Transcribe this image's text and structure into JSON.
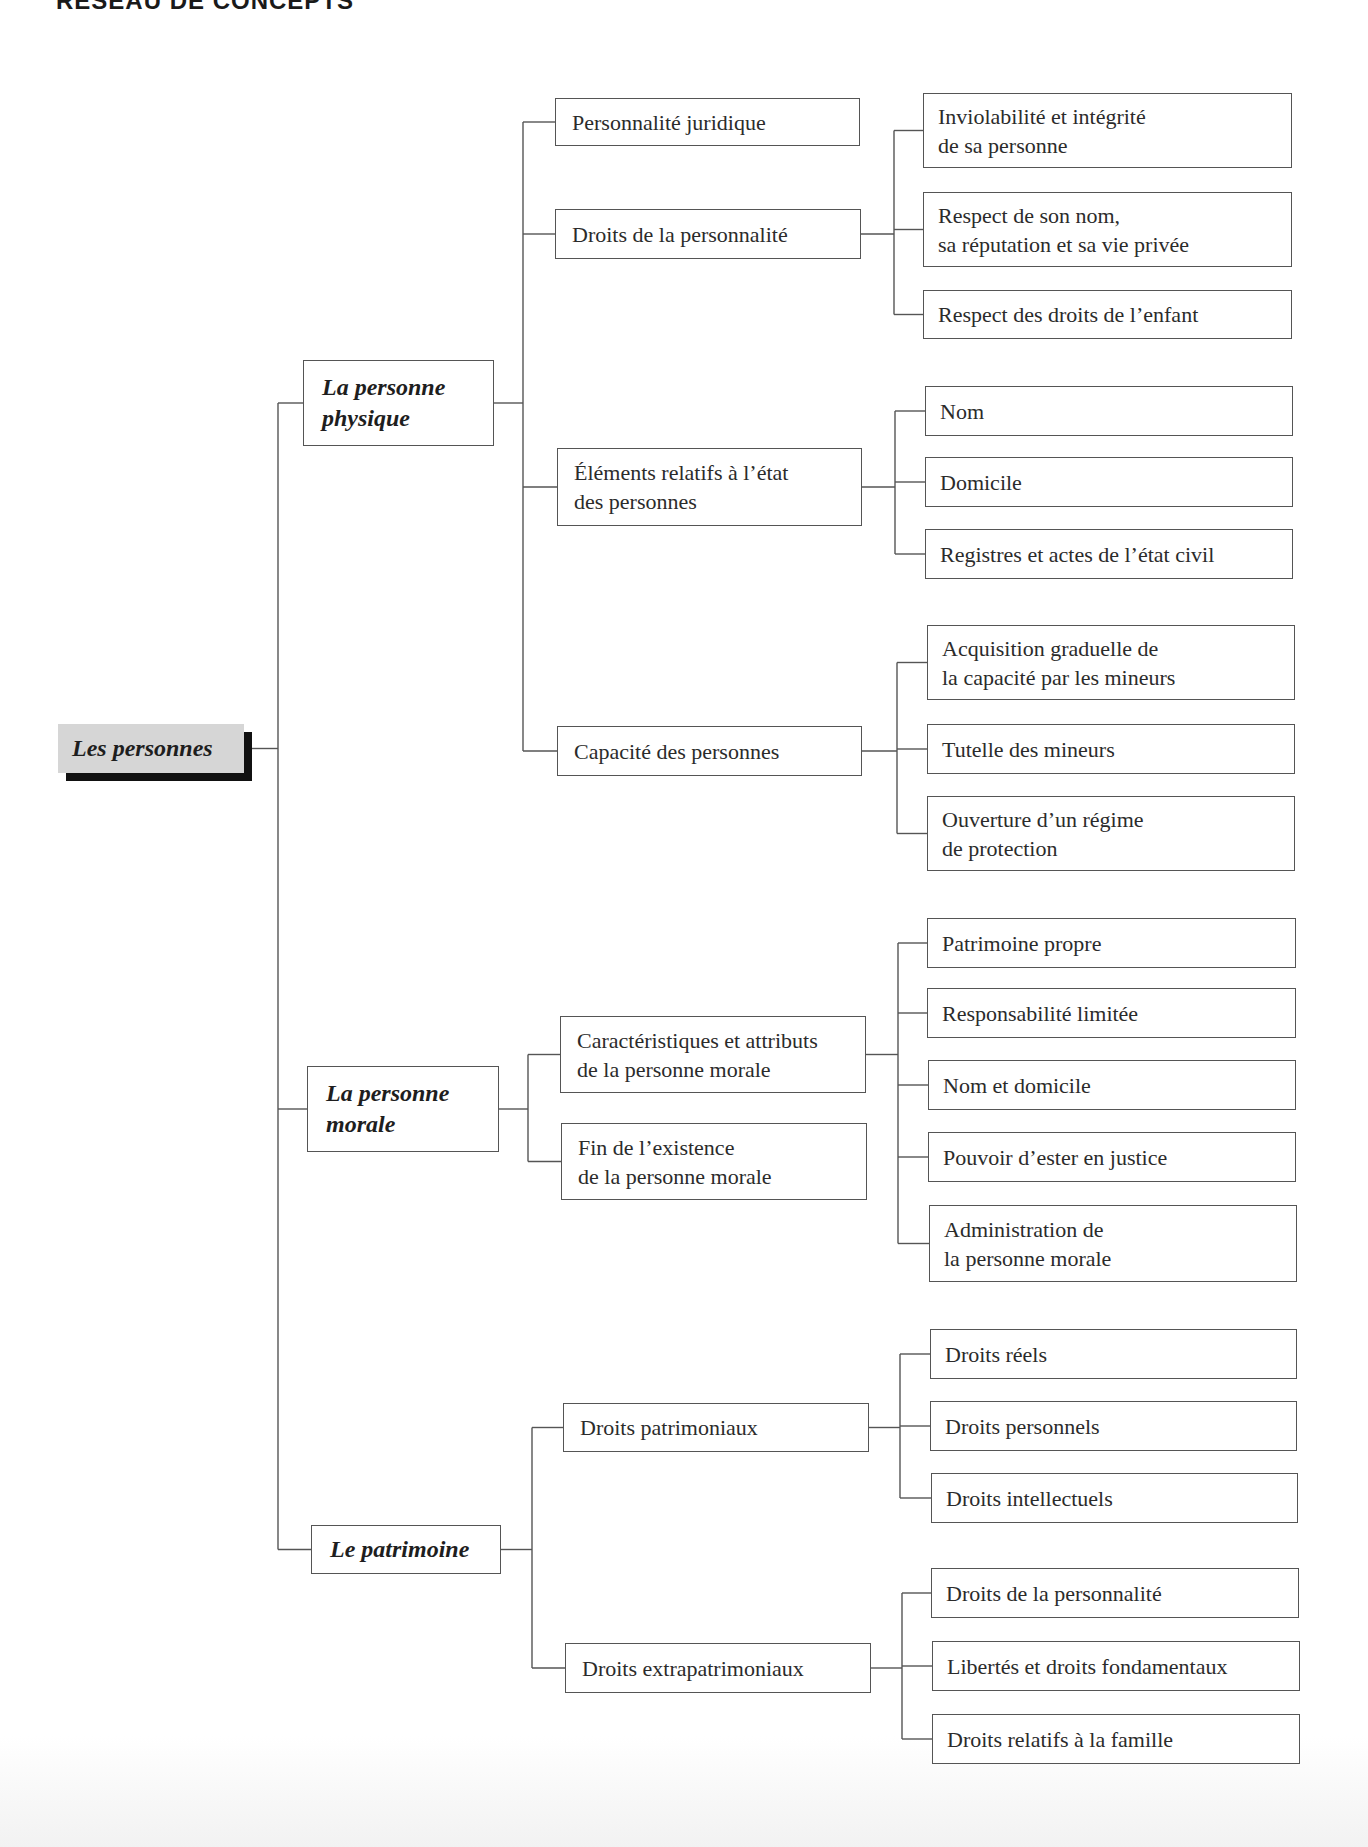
{
  "header": {
    "title_partial": "RÉSEAU DE CONCEPTS"
  },
  "colors": {
    "line": "#555555",
    "root_fill": "#d6d6d6",
    "root_shadow": "#111111",
    "text": "#2b2b2b"
  },
  "root": {
    "label": "Les personnes",
    "x": 58,
    "y": 724,
    "w": 186,
    "h": 49
  },
  "trunk": {
    "x": 278
  },
  "branches": [
    {
      "label": "La personne\nphysique",
      "x": 303,
      "y": 360,
      "w": 191,
      "h": 86,
      "spine_x": 523,
      "children": [
        {
          "label": "Personnalité juridique",
          "x": 555,
          "y": 98,
          "w": 305,
          "h": 48,
          "children": []
        },
        {
          "label": "Droits de la personnalité",
          "x": 555,
          "y": 209,
          "w": 306,
          "h": 50,
          "spine_x": 894,
          "children": [
            {
              "label": "Inviolabilité et intégrité\nde sa personne",
              "x": 923,
              "y": 93,
              "w": 369,
              "h": 75
            },
            {
              "label": "Respect de son nom,\nsa réputation et sa vie privée",
              "x": 923,
              "y": 192,
              "w": 369,
              "h": 75
            },
            {
              "label": "Respect des droits de l’enfant",
              "x": 923,
              "y": 290,
              "w": 369,
              "h": 49
            }
          ]
        },
        {
          "label": "Éléments relatifs à l’état\ndes personnes",
          "x": 557,
          "y": 448,
          "w": 305,
          "h": 78,
          "spine_x": 895,
          "children": [
            {
              "label": "Nom",
              "x": 925,
              "y": 386,
              "w": 368,
              "h": 50
            },
            {
              "label": "Domicile",
              "x": 925,
              "y": 457,
              "w": 368,
              "h": 50
            },
            {
              "label": "Registres et actes de l’état civil",
              "x": 925,
              "y": 529,
              "w": 368,
              "h": 50
            }
          ]
        },
        {
          "label": "Capacité des personnes",
          "x": 557,
          "y": 726,
          "w": 305,
          "h": 50,
          "spine_x": 897,
          "children": [
            {
              "label": "Acquisition graduelle de\nla capacité par les mineurs",
              "x": 927,
              "y": 625,
              "w": 368,
              "h": 75
            },
            {
              "label": "Tutelle des mineurs",
              "x": 927,
              "y": 724,
              "w": 368,
              "h": 50
            },
            {
              "label": "Ouverture d’un régime\nde protection",
              "x": 927,
              "y": 796,
              "w": 368,
              "h": 75
            }
          ]
        }
      ]
    },
    {
      "label": "La personne\nmorale",
      "x": 307,
      "y": 1066,
      "w": 192,
      "h": 86,
      "spine_x": 528,
      "children": [
        {
          "label": "Caractéristiques et attributs\nde la personne morale",
          "x": 560,
          "y": 1016,
          "w": 306,
          "h": 77,
          "spine_x": 898,
          "children": [
            {
              "label": "Patrimoine propre",
              "x": 927,
              "y": 918,
              "w": 369,
              "h": 50
            },
            {
              "label": "Responsabilité limitée",
              "x": 927,
              "y": 988,
              "w": 369,
              "h": 50
            },
            {
              "label": "Nom et domicile",
              "x": 928,
              "y": 1060,
              "w": 368,
              "h": 50
            },
            {
              "label": "Pouvoir d’ester en justice",
              "x": 928,
              "y": 1132,
              "w": 368,
              "h": 50
            },
            {
              "label": "Administration de\nla personne morale",
              "x": 929,
              "y": 1205,
              "w": 368,
              "h": 77
            }
          ]
        },
        {
          "label": "Fin de l’existence\nde la personne morale",
          "x": 561,
          "y": 1123,
          "w": 306,
          "h": 77,
          "children": []
        }
      ]
    },
    {
      "label": "Le patrimoine",
      "x": 311,
      "y": 1525,
      "w": 190,
      "h": 49,
      "spine_x": 532,
      "children": [
        {
          "label": "Droits patrimoniaux",
          "x": 563,
          "y": 1403,
          "w": 306,
          "h": 49,
          "spine_x": 900,
          "children": [
            {
              "label": "Droits réels",
              "x": 930,
              "y": 1329,
              "w": 367,
              "h": 50
            },
            {
              "label": "Droits personnels",
              "x": 930,
              "y": 1401,
              "w": 367,
              "h": 50
            },
            {
              "label": "Droits intellectuels",
              "x": 931,
              "y": 1473,
              "w": 367,
              "h": 50
            }
          ]
        },
        {
          "label": "Droits extrapatrimoniaux",
          "x": 565,
          "y": 1643,
          "w": 306,
          "h": 50,
          "spine_x": 902,
          "children": [
            {
              "label": "Droits de la personnalité",
              "x": 931,
              "y": 1568,
              "w": 368,
              "h": 50
            },
            {
              "label": "Libertés et droits fondamentaux",
              "x": 932,
              "y": 1641,
              "w": 368,
              "h": 50
            },
            {
              "label": "Droits relatifs à la famille",
              "x": 932,
              "y": 1714,
              "w": 368,
              "h": 50
            }
          ]
        }
      ]
    }
  ]
}
